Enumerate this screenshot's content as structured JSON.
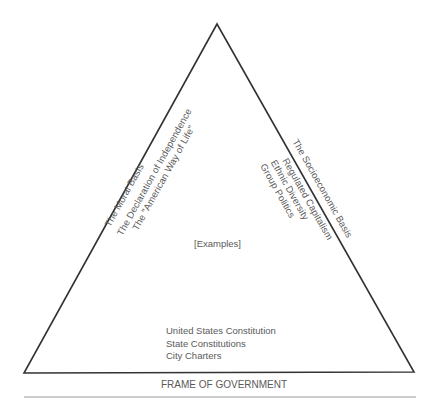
{
  "diagram": {
    "shape": "triangle",
    "line_color": "#333333",
    "text_color": "#5a5a5a",
    "center_label": "[Examples]",
    "left_side": {
      "heading": "The Moral Basis",
      "examples": [
        "The Declaration of Independence",
        "The \"American Way of Life\""
      ]
    },
    "right_side": {
      "heading": "The Socioeconomic Basis",
      "examples": [
        "Regulated Capitalism",
        "Ethnic Diversity",
        "Group Politics"
      ]
    },
    "base": {
      "heading": "FRAME OF GOVERNMENT",
      "examples": [
        "United States Constitution",
        "State Constitutions",
        "City Charters"
      ]
    }
  }
}
